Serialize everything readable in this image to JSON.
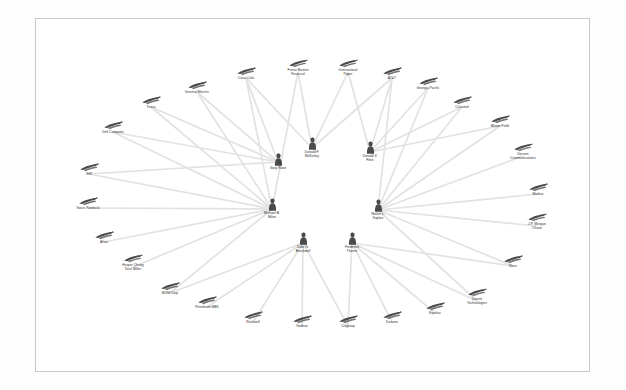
{
  "view": {
    "kind": "network-graph",
    "background_color": "#fdfdfd",
    "canvas_color": "#ffffff",
    "canvas_border_color": "#c9c9c9",
    "edge_color": "#e2e2e2",
    "node_icon_color": "#4a4a4a",
    "label_color": "#2b2b2b"
  },
  "chart_data": {
    "type": "network",
    "title": "",
    "layout": "radial",
    "legend": "none",
    "grid": false,
    "person_nodes": [
      {
        "id": "p1",
        "label": "Gary Rose",
        "x": 278,
        "y": 162,
        "icon": "person-icon"
      },
      {
        "id": "p2",
        "label": "Donald F.\nMcKinley",
        "x": 312,
        "y": 148,
        "icon": "person-icon"
      },
      {
        "id": "p3",
        "label": "Donald V.\nFites",
        "x": 370,
        "y": 152,
        "icon": "person-icon"
      },
      {
        "id": "p4",
        "label": "Michael B.\nMiles",
        "x": 272,
        "y": 209,
        "icon": "person-icon"
      },
      {
        "id": "p5",
        "label": "Walter L.\nKaplan",
        "x": 378,
        "y": 210,
        "icon": "person-icon"
      },
      {
        "id": "p6",
        "label": "Dale G.\nBrockwell",
        "x": 303,
        "y": 243,
        "icon": "person-icon"
      },
      {
        "id": "p7",
        "label": "Frederick\nThorne",
        "x": 352,
        "y": 243,
        "icon": "person-icon"
      }
    ],
    "company_nodes": [
      {
        "id": "c01",
        "label": "Coca-Cola",
        "x": 246,
        "y": 74,
        "icon": "company-icon"
      },
      {
        "id": "c02",
        "label": "Firstar Boston\nFinancial",
        "x": 298,
        "y": 68,
        "icon": "company-icon"
      },
      {
        "id": "c03",
        "label": "International\nPaper",
        "x": 348,
        "y": 68,
        "icon": "company-icon"
      },
      {
        "id": "c04",
        "label": "AT&T",
        "x": 392,
        "y": 74,
        "icon": "company-icon"
      },
      {
        "id": "c05",
        "label": "Georgia Pacific",
        "x": 428,
        "y": 84,
        "icon": "company-icon"
      },
      {
        "id": "c06",
        "label": "Circuited",
        "x": 462,
        "y": 103,
        "icon": "company-icon"
      },
      {
        "id": "c07",
        "label": "Bloom Field",
        "x": 500,
        "y": 122,
        "icon": "company-icon"
      },
      {
        "id": "c08",
        "label": "Verizon\nCommunications",
        "x": 523,
        "y": 152,
        "icon": "company-icon"
      },
      {
        "id": "c09",
        "label": "Medius",
        "x": 538,
        "y": 190,
        "icon": "company-icon"
      },
      {
        "id": "c10",
        "label": "J.P. Morgan\nChase",
        "x": 537,
        "y": 222,
        "icon": "company-icon"
      },
      {
        "id": "c11",
        "label": "Ross",
        "x": 513,
        "y": 262,
        "icon": "company-icon"
      },
      {
        "id": "c12",
        "label": "Lucent\nTechnologies",
        "x": 477,
        "y": 297,
        "icon": "company-icon"
      },
      {
        "id": "c13",
        "label": "Equifax",
        "x": 435,
        "y": 309,
        "icon": "company-icon"
      },
      {
        "id": "c14",
        "label": "Danone",
        "x": 392,
        "y": 318,
        "icon": "company-icon"
      },
      {
        "id": "c15",
        "label": "Citigroup",
        "x": 348,
        "y": 322,
        "icon": "company-icon"
      },
      {
        "id": "c16",
        "label": "Sodexo",
        "x": 302,
        "y": 322,
        "icon": "company-icon"
      },
      {
        "id": "c17",
        "label": "Rockwell",
        "x": 253,
        "y": 318,
        "icon": "company-icon"
      },
      {
        "id": "c18",
        "label": "Petroleum MBK",
        "x": 207,
        "y": 303,
        "icon": "company-icon"
      },
      {
        "id": "c19",
        "label": "MGM Corp",
        "x": 170,
        "y": 289,
        "icon": "company-icon"
      },
      {
        "id": "c20",
        "label": "Harper Chang\nDeal Miller",
        "x": 133,
        "y": 263,
        "icon": "company-icon"
      },
      {
        "id": "c21",
        "label": "Altria",
        "x": 104,
        "y": 238,
        "icon": "company-icon"
      },
      {
        "id": "c22",
        "label": "Sears Roebuck",
        "x": 88,
        "y": 204,
        "icon": "company-icon"
      },
      {
        "id": "c23",
        "label": "IHR",
        "x": 89,
        "y": 170,
        "icon": "company-icon"
      },
      {
        "id": "c24",
        "label": "Dell Computer",
        "x": 113,
        "y": 128,
        "icon": "company-icon"
      },
      {
        "id": "c25",
        "label": "Tosco",
        "x": 151,
        "y": 103,
        "icon": "company-icon"
      },
      {
        "id": "c26",
        "label": "General Electric",
        "x": 197,
        "y": 88,
        "icon": "company-icon"
      }
    ],
    "edges": [
      {
        "from": "p1",
        "to": "c01"
      },
      {
        "from": "p1",
        "to": "c25"
      },
      {
        "from": "p1",
        "to": "c26"
      },
      {
        "from": "p1",
        "to": "c24"
      },
      {
        "from": "p1",
        "to": "c23"
      },
      {
        "from": "p2",
        "to": "c01"
      },
      {
        "from": "p2",
        "to": "c02"
      },
      {
        "from": "p2",
        "to": "c03"
      },
      {
        "from": "p2",
        "to": "c04"
      },
      {
        "from": "p3",
        "to": "c03"
      },
      {
        "from": "p3",
        "to": "c04"
      },
      {
        "from": "p3",
        "to": "c05"
      },
      {
        "from": "p3",
        "to": "c06"
      },
      {
        "from": "p3",
        "to": "c07"
      },
      {
        "from": "p4",
        "to": "c26"
      },
      {
        "from": "p4",
        "to": "c25"
      },
      {
        "from": "p4",
        "to": "c24"
      },
      {
        "from": "p4",
        "to": "c23"
      },
      {
        "from": "p4",
        "to": "c22"
      },
      {
        "from": "p4",
        "to": "c21"
      },
      {
        "from": "p4",
        "to": "c20"
      },
      {
        "from": "p4",
        "to": "c19"
      },
      {
        "from": "p4",
        "to": "c01"
      },
      {
        "from": "p4",
        "to": "c02"
      },
      {
        "from": "p5",
        "to": "c05"
      },
      {
        "from": "p5",
        "to": "c06"
      },
      {
        "from": "p5",
        "to": "c07"
      },
      {
        "from": "p5",
        "to": "c08"
      },
      {
        "from": "p5",
        "to": "c09"
      },
      {
        "from": "p5",
        "to": "c10"
      },
      {
        "from": "p5",
        "to": "c11"
      },
      {
        "from": "p5",
        "to": "c12"
      },
      {
        "from": "p5",
        "to": "c04"
      },
      {
        "from": "p6",
        "to": "c19"
      },
      {
        "from": "p6",
        "to": "c18"
      },
      {
        "from": "p6",
        "to": "c17"
      },
      {
        "from": "p6",
        "to": "c16"
      },
      {
        "from": "p6",
        "to": "c15"
      },
      {
        "from": "p7",
        "to": "c15"
      },
      {
        "from": "p7",
        "to": "c14"
      },
      {
        "from": "p7",
        "to": "c13"
      },
      {
        "from": "p7",
        "to": "c12"
      },
      {
        "from": "p7",
        "to": "c11"
      }
    ]
  }
}
